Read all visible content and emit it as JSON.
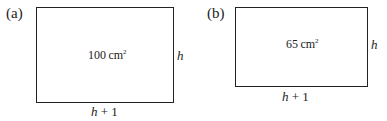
{
  "figures": [
    {
      "label": "(a)",
      "area_value": "100",
      "area_unit": "cm",
      "area_exp": "2",
      "side_label": "h",
      "bottom_var": "h",
      "bottom_rest": " + 1"
    },
    {
      "label": "(b)",
      "area_value": "65",
      "area_unit": "cm",
      "area_exp": "2",
      "side_label": "h",
      "bottom_var": "h",
      "bottom_rest": " + 1"
    }
  ]
}
